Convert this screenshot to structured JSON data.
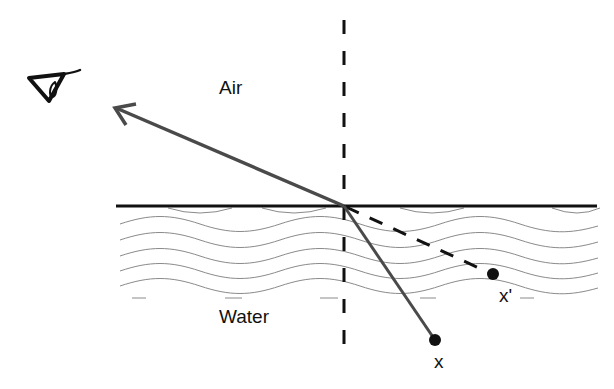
{
  "diagram": {
    "labels": {
      "air": "Air",
      "water": "Water",
      "object": "x",
      "apparent_object": "x'"
    },
    "icons": {
      "observer": "eye-icon"
    },
    "colors": {
      "ray": "#4a4a4a",
      "surface": "#111111",
      "normal": "#111111",
      "waves": "#8a8a8a",
      "points": "#111111"
    }
  }
}
